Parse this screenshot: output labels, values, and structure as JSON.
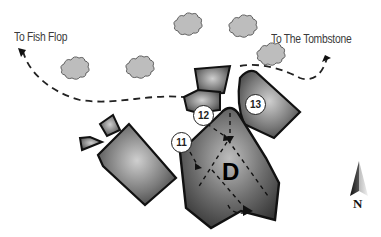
{
  "map": {
    "destinations": [
      {
        "id": "fish-flop",
        "label": "To Fish Flop"
      },
      {
        "id": "tombstone",
        "label": "To The Tombstone"
      }
    ],
    "markers": [
      {
        "id": "11",
        "label": "11"
      },
      {
        "id": "12",
        "label": "12"
      },
      {
        "id": "13",
        "label": "13"
      }
    ],
    "building": {
      "label": "D"
    },
    "compass": {
      "label": "N"
    },
    "colors": {
      "building_fill_light": "#c8c8c8",
      "building_fill_dark": "#3c3c3c",
      "outline": "#111111",
      "cloud_fill": "#bdbdbd",
      "path": "#222222"
    }
  }
}
